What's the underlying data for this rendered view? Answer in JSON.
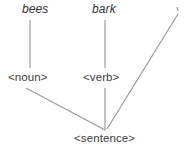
{
  "figure": {
    "name": "syntactic-parse-tree",
    "background_color": "#ffffff",
    "line_color": "#9a9a9a",
    "text_color": "#3a3a3a",
    "width": 193,
    "height": 154
  },
  "nodes": {
    "terminal_left": "bees",
    "terminal_right": "bark",
    "nonterminal_left": "<noun>",
    "nonterminal_right": "<verb>",
    "root": "<sentence>"
  },
  "edges": [
    {
      "name": "bees-to-noun",
      "from": "bees",
      "to": "<noun>",
      "x1": 30,
      "y1": 20,
      "x2": 30,
      "y2": 68
    },
    {
      "name": "bark-to-verb",
      "from": "bark",
      "to": "<verb>",
      "x1": 105,
      "y1": 20,
      "x2": 105,
      "y2": 68
    },
    {
      "name": "noun-to-sentence",
      "from": "<noun>",
      "to": "<sentence>",
      "x1": 26,
      "y1": 88,
      "x2": 105,
      "y2": 130
    },
    {
      "name": "verb-to-sentence",
      "from": "<verb>",
      "to": "<sentence>",
      "x1": 105,
      "y1": 88,
      "x2": 105,
      "y2": 130
    },
    {
      "name": "right-branch-to-sentence",
      "from": "",
      "to": "<sentence>",
      "x1": 178,
      "y1": 12,
      "x2": 107,
      "y2": 129
    }
  ],
  "marks": {
    "top_right_tick": {
      "name": "top-right-tick-mark",
      "x": 177,
      "y": 9
    }
  }
}
